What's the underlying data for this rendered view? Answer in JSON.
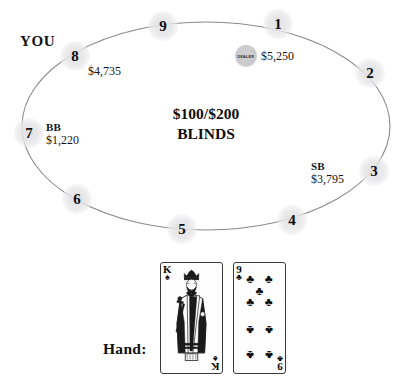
{
  "table": {
    "blinds_text_line1": "$100/$200",
    "blinds_text_line2": "BLINDS",
    "hero_label": "YOU",
    "dealer_button_label": "DEALER",
    "seats": [
      {
        "number": "1",
        "stack": "$5,250",
        "position_tag": "",
        "x": 278,
        "y": 24
      },
      {
        "number": "2",
        "stack": "",
        "position_tag": "",
        "x": 370,
        "y": 73
      },
      {
        "number": "3",
        "stack": "$3,795",
        "position_tag": "SB",
        "x": 374,
        "y": 171
      },
      {
        "number": "4",
        "stack": "",
        "position_tag": "",
        "x": 292,
        "y": 220
      },
      {
        "number": "5",
        "stack": "",
        "position_tag": "",
        "x": 182,
        "y": 229
      },
      {
        "number": "6",
        "stack": "",
        "position_tag": "",
        "x": 77,
        "y": 199
      },
      {
        "number": "7",
        "stack": "$1,220",
        "position_tag": "BB",
        "x": 29,
        "y": 133
      },
      {
        "number": "8",
        "stack": "$4,735",
        "position_tag": "",
        "x": 75,
        "y": 56
      },
      {
        "number": "9",
        "stack": "",
        "position_tag": "",
        "x": 163,
        "y": 26
      }
    ]
  },
  "hand": {
    "label": "Hand:",
    "cards": [
      {
        "rank": "K",
        "suit": "spades",
        "suit_glyph": "♠",
        "name": "king-of-spades"
      },
      {
        "rank": "9",
        "suit": "clubs",
        "suit_glyph": "♣",
        "name": "nine-of-clubs"
      }
    ]
  },
  "colors": {
    "background": "#ffffff",
    "text": "#111111",
    "oval_stroke": "#8a8a8a",
    "seat_marker": "#e6e6e8",
    "dealer_button": "#c9c9cc"
  }
}
